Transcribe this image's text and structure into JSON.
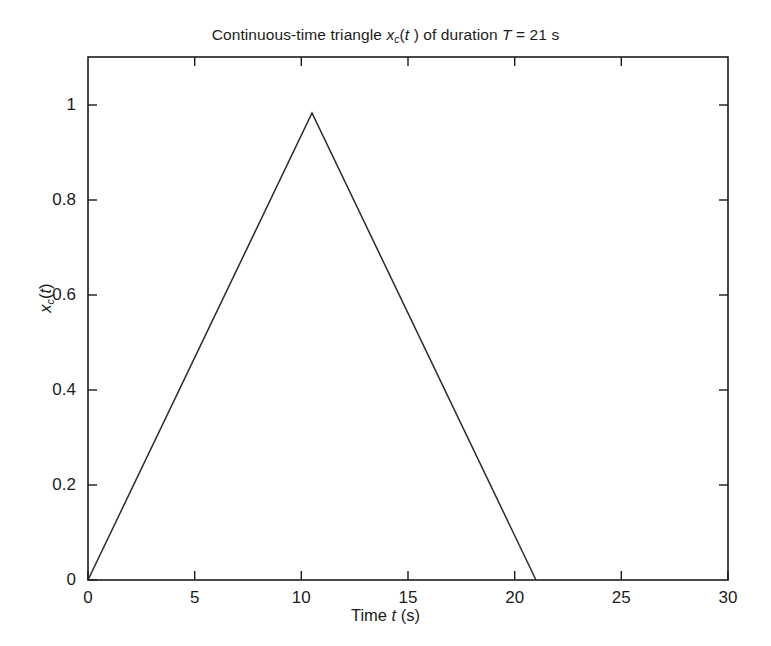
{
  "figure": {
    "width": 771,
    "height": 646,
    "background": "#ffffff",
    "line_color": "#2a2a2a",
    "axis_color": "#1c1c1c"
  },
  "title": {
    "prefix": "Continuous-time triangle ",
    "signal_var": "x",
    "signal_sub": "c",
    "signal_arg": "(t )",
    "middle": " of duration ",
    "param": "T",
    "equals": " = 21 s"
  },
  "axes": {
    "x_label_prefix": "Time ",
    "x_label_var": "t",
    "x_label_unit": " (s)",
    "y_label_var": "x",
    "y_label_sub": "c",
    "y_label_arg": "(t)"
  },
  "chart_data": {
    "type": "line",
    "xlabel": "Time t (s)",
    "ylabel": "x_c(t)",
    "xlim": [
      0,
      30
    ],
    "ylim": [
      0,
      1.12
    ],
    "xticks": [
      0,
      5,
      10,
      15,
      20,
      25,
      30
    ],
    "xtick_labels": [
      "0",
      "5",
      "10",
      "15",
      "20",
      "25",
      "30"
    ],
    "yticks": [
      0,
      0.2,
      0.4,
      0.6,
      0.8,
      1
    ],
    "ytick_labels": [
      "0",
      "0.2",
      "0.4",
      "0.6",
      "0.8",
      "1"
    ],
    "grid": false,
    "legend": "none",
    "series": [
      {
        "name": "x_c(t)",
        "color": "#2a2a2a",
        "line_width": 1.5,
        "x": [
          0,
          10.5,
          21
        ],
        "values": [
          0,
          1,
          0
        ]
      }
    ],
    "annotations": {
      "duration_T": 21,
      "peak_time": 10.5,
      "peak_amplitude": 1
    }
  }
}
